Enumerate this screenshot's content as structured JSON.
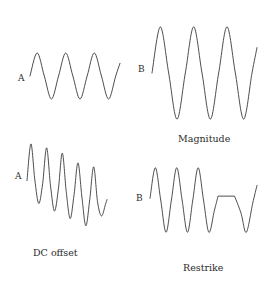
{
  "figure": {
    "title": "",
    "background_color": "#ffffff",
    "stroke_color": "#3a3a3a",
    "text_color": "#2b2b2b",
    "width": 277,
    "height": 287
  },
  "panels": {
    "top_left": {
      "axis_label": "A",
      "caption": "",
      "description": "sine wave, moderate amplitude, three cycles"
    },
    "top_right": {
      "axis_label": "B",
      "caption": "Magnitude",
      "description": "sine wave, large amplitude, three cycles"
    },
    "bottom_left": {
      "axis_label": "A",
      "caption": "DC offset",
      "description": "sine wave with decaying amplitude and downward drifting baseline, five cycles"
    },
    "bottom_right": {
      "axis_label": "B",
      "caption": "Restrike",
      "description": "sine wave, three cycles, then flat plateau, then final dip"
    }
  },
  "chart_data": {
    "type": "line",
    "title": "",
    "xlabel": "",
    "ylabel": "",
    "grid": false,
    "legend": "none",
    "subplots": [
      {
        "id": "top_left",
        "axis_label": "A",
        "caption": "",
        "xlim": [
          0,
          3.15
        ],
        "ylim": [
          -1.3,
          1.3
        ],
        "waveform": "sine",
        "amplitude": 1.0,
        "cycles": 3,
        "phase_start_deg": 0,
        "baseline": 0,
        "dc_drift_per_cycle": 0,
        "amplitude_decay_per_cycle": 0,
        "points_t": [
          0.0,
          0.25,
          0.5,
          0.75,
          1.0,
          1.25,
          1.5,
          1.75,
          2.0,
          2.25,
          2.5,
          2.75,
          3.0,
          3.15
        ],
        "points_y": [
          0.0,
          1.0,
          0.0,
          -1.0,
          0.0,
          1.0,
          0.0,
          -1.0,
          0.0,
          1.0,
          0.0,
          -1.0,
          0.0,
          0.55
        ]
      },
      {
        "id": "top_right",
        "axis_label": "B",
        "caption": "Magnitude",
        "xlim": [
          0,
          3.15
        ],
        "ylim": [
          -1.3,
          1.3
        ],
        "waveform": "sine",
        "amplitude": 1.0,
        "cycles": 3,
        "phase_start_deg": 0,
        "baseline": 0,
        "dc_drift_per_cycle": 0,
        "amplitude_decay_per_cycle": 0,
        "points_t": [
          0.0,
          0.25,
          0.5,
          0.75,
          1.0,
          1.25,
          1.5,
          1.75,
          2.0,
          2.25,
          2.5,
          2.75,
          3.0,
          3.15
        ],
        "points_y": [
          0.0,
          1.0,
          0.0,
          -1.0,
          0.0,
          1.0,
          0.0,
          -1.0,
          0.0,
          1.0,
          0.0,
          -1.0,
          0.0,
          0.55
        ]
      },
      {
        "id": "bottom_left",
        "axis_label": "A",
        "caption": "DC offset",
        "xlim": [
          0,
          5.1
        ],
        "ylim": [
          -1.75,
          1.15
        ],
        "waveform": "sine",
        "amplitude": 1.0,
        "cycles": 5,
        "phase_start_deg": 0,
        "baseline": 0,
        "dc_drift_per_cycle": -0.18,
        "amplitude_decay_per_cycle": -0.13,
        "points_t": [
          0.0,
          0.25,
          0.5,
          0.75,
          1.0,
          1.25,
          1.5,
          1.75,
          2.0,
          2.25,
          2.5,
          2.75,
          3.0,
          3.25,
          3.5,
          3.75,
          4.0,
          4.25,
          4.5,
          4.75,
          5.0,
          5.1
        ],
        "points_y": [
          -0.12,
          1.0,
          -0.1,
          -0.82,
          -0.2,
          0.88,
          -0.28,
          -1.05,
          -0.38,
          0.72,
          -0.45,
          -1.28,
          -0.55,
          0.42,
          -0.62,
          -1.5,
          -0.7,
          0.3,
          -0.78,
          -1.2,
          -0.85,
          -0.7
        ]
      },
      {
        "id": "bottom_right",
        "axis_label": "B",
        "caption": "Restrike",
        "xlim": [
          0,
          5.0
        ],
        "ylim": [
          -1.3,
          1.3
        ],
        "waveform": "sine-with-plateau",
        "amplitude": 1.0,
        "cycles": 3,
        "phase_start_deg": 0,
        "baseline": 0,
        "plateau_level": 0.12,
        "plateau_t_start": 3.18,
        "plateau_t_end": 3.95,
        "points_t": [
          0.0,
          0.25,
          0.5,
          0.75,
          1.0,
          1.25,
          1.5,
          1.75,
          2.0,
          2.25,
          2.5,
          2.75,
          3.0,
          3.18,
          3.95,
          4.25,
          4.5,
          4.8,
          5.0
        ],
        "points_y": [
          0.05,
          1.0,
          0.0,
          -1.0,
          0.0,
          1.0,
          0.0,
          -1.0,
          0.0,
          1.0,
          0.0,
          -1.0,
          -0.35,
          0.12,
          0.12,
          -0.4,
          -1.0,
          -0.1,
          0.45
        ]
      }
    ]
  }
}
